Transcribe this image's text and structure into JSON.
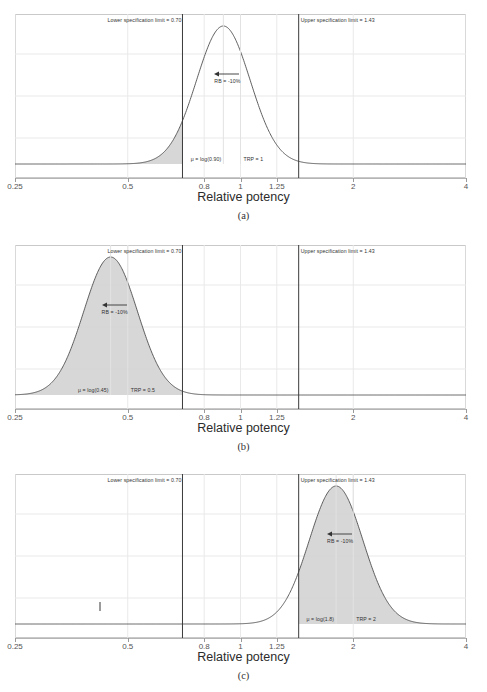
{
  "figure": {
    "axis_title": "Relative potency",
    "x_ticks": [
      {
        "value": 0.25,
        "label": "0.25"
      },
      {
        "value": 0.5,
        "label": "0.5"
      },
      {
        "value": 0.8,
        "label": "0.8"
      },
      {
        "value": 1,
        "label": "1"
      },
      {
        "value": 1.25,
        "label": "1.25"
      },
      {
        "value": 2,
        "label": "2"
      },
      {
        "value": 4,
        "label": "4"
      }
    ],
    "x_min": 0.25,
    "x_max": 4,
    "scale": "log",
    "lsl_value": 0.7,
    "usl_value": 1.43,
    "lsl_label": "Lower specification limit = 0.70",
    "usl_label": "Upper specification limit = 1.43",
    "curve_color": "#4d4d4d",
    "limit_line_color": "#3a3a3a",
    "grid_color": "#e9e9e9",
    "shade_color": "#d0d0d0"
  },
  "panels": [
    {
      "id": "a",
      "label": "(a)",
      "mu_label": "μ = log(0.90)",
      "trp_label": "TRP = 1",
      "rb_label": "RB = -10%",
      "mu_value": 0.9,
      "trp_value": 1,
      "sigma_log": 0.165,
      "shade_side": "below",
      "shade_at": 0.7,
      "peak_height": 1.0
    },
    {
      "id": "b",
      "label": "(b)",
      "mu_label": "μ = log(0.45)",
      "trp_label": "TRP = 0.5",
      "rb_label": "RB = -10%",
      "mu_value": 0.45,
      "trp_value": 0.5,
      "sigma_log": 0.165,
      "shade_side": "below",
      "shade_at": 0.7,
      "peak_height": 1.0
    },
    {
      "id": "c",
      "label": "(c)",
      "mu_label": "μ = log(1.8)",
      "trp_label": "TRP = 2",
      "rb_label": "RB = -10%",
      "mu_value": 1.8,
      "trp_value": 2,
      "sigma_log": 0.165,
      "shade_side": "above",
      "shade_at": 1.43,
      "peak_height": 1.0
    }
  ],
  "chart_data": {
    "type": "area",
    "title": "",
    "xlabel": "Relative potency",
    "ylabel": "",
    "xscale": "log",
    "xlim": [
      0.25,
      4
    ],
    "grid": true,
    "legend": "none",
    "x_tick_values": [
      0.25,
      0.5,
      0.8,
      1,
      1.25,
      2,
      4
    ],
    "x_tick_labels": [
      "0.25",
      "0.5",
      "0.8",
      "1",
      "1.25",
      "2",
      "4"
    ],
    "reference_lines": [
      {
        "name": "Lower specification limit",
        "value": 0.7,
        "label": "Lower specification limit = 0.70"
      },
      {
        "name": "Upper specification limit",
        "value": 1.43,
        "label": "Upper specification limit = 1.43"
      }
    ],
    "series": [
      {
        "name": "(a)",
        "distribution": "lognormal",
        "median": 0.9,
        "sigma_log": 0.165,
        "target_relative_potency": 1,
        "relative_bias_percent": -10,
        "shaded_region": "x < 0.70",
        "annotations": [
          "μ = log(0.90)",
          "TRP = 1",
          "RB = -10%"
        ]
      },
      {
        "name": "(b)",
        "distribution": "lognormal",
        "median": 0.45,
        "sigma_log": 0.165,
        "target_relative_potency": 0.5,
        "relative_bias_percent": -10,
        "shaded_region": "x < 0.70",
        "annotations": [
          "μ = log(0.45)",
          "TRP = 0.5",
          "RB = -10%"
        ]
      },
      {
        "name": "(c)",
        "distribution": "lognormal",
        "median": 1.8,
        "sigma_log": 0.165,
        "target_relative_potency": 2,
        "relative_bias_percent": -10,
        "shaded_region": "x > 1.43",
        "annotations": [
          "μ = log(1.8)",
          "TRP = 2",
          "RB = -10%"
        ]
      }
    ]
  }
}
